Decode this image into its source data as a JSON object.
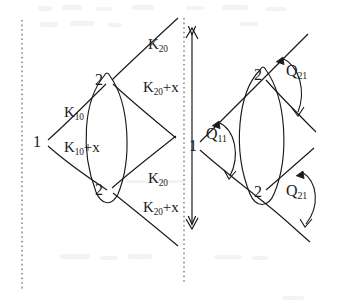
{
  "figure": {
    "ink_color": "#1a1a1a",
    "background_color": "#ffffff"
  },
  "left_diagram": {
    "nodes": [
      {
        "id": "left-node-1",
        "label": "1",
        "x": 36,
        "y": 142
      },
      {
        "id": "left-node-2-top",
        "label": "2",
        "x": 99,
        "y": 82
      },
      {
        "id": "left-node-2-bottom",
        "label": "2",
        "x": 99,
        "y": 190
      }
    ],
    "labels": [
      {
        "id": "k10",
        "base": "K",
        "sub": "10",
        "suffix": "",
        "x": 66,
        "y": 110
      },
      {
        "id": "k10-plus-x",
        "base": "K",
        "sub": "10",
        "suffix": "+x",
        "x": 66,
        "y": 145
      },
      {
        "id": "k20-top",
        "base": "K",
        "sub": "20",
        "suffix": "",
        "x": 150,
        "y": 42
      },
      {
        "id": "k20-plus-x-top",
        "base": "K",
        "sub": "20",
        "suffix": "+x",
        "x": 146,
        "y": 84
      },
      {
        "id": "k20-bottom",
        "base": "K",
        "sub": "20",
        "suffix": "",
        "x": 150,
        "y": 176
      },
      {
        "id": "k20-plus-x-bottom",
        "base": "K",
        "sub": "20",
        "suffix": "+x",
        "x": 146,
        "y": 205
      }
    ]
  },
  "right_diagram": {
    "nodes": [
      {
        "id": "right-node-1",
        "label": "1",
        "x": 191,
        "y": 146
      },
      {
        "id": "right-node-2-top",
        "label": "2",
        "x": 257,
        "y": 76
      },
      {
        "id": "right-node-2-bottom",
        "label": "2",
        "x": 257,
        "y": 192
      }
    ],
    "labels": [
      {
        "id": "q11",
        "base": "Q",
        "sub": "11",
        "suffix": "",
        "x": 208,
        "y": 132
      },
      {
        "id": "q21-top",
        "base": "Q",
        "sub": "21",
        "suffix": "",
        "x": 288,
        "y": 70
      },
      {
        "id": "q21-bottom",
        "base": "Q",
        "sub": "21",
        "suffix": "",
        "x": 288,
        "y": 190
      }
    ]
  },
  "separator": {
    "dotted_line_left": {
      "id": "dotted-axis-left",
      "x": 22,
      "y_top": 20,
      "y_bottom": 290
    },
    "dotted_line_center": {
      "id": "dotted-axis-center",
      "x": 184,
      "y_top": 18,
      "y_bottom": 282
    },
    "double_arrow": {
      "id": "vertical-double-arrow",
      "x": 192,
      "y_top": 28,
      "y_bottom": 228
    }
  },
  "icons": {
    "arrowhead": "arrowhead-icon",
    "dotted_axis": "dotted-axis-icon",
    "angle_arc": "angle-arc-icon",
    "lens_shape": "lens-shape-icon"
  }
}
